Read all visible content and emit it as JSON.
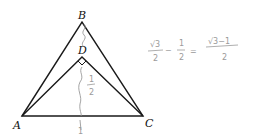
{
  "diagram": {
    "points": {
      "A": {
        "label": "A",
        "x": 22,
        "y": 116
      },
      "B": {
        "label": "B",
        "x": 82,
        "y": 22
      },
      "C": {
        "label": "C",
        "x": 143,
        "y": 116
      },
      "D": {
        "label": "D",
        "x": 82,
        "y": 57
      }
    },
    "annotations": {
      "bd_length": "",
      "dh_length": "1/2",
      "dh_num": "1",
      "dh_den": "2",
      "base_length": "1",
      "expression_left_num": "√3",
      "expression_left_den": "2",
      "minus": "−",
      "half_num": "1",
      "half_den": "2",
      "equals": "=",
      "result_num": "√3−1",
      "result_den": "2"
    },
    "colors": {
      "line": "#1a1a1a",
      "handwriting": "#9a9a9a"
    }
  }
}
